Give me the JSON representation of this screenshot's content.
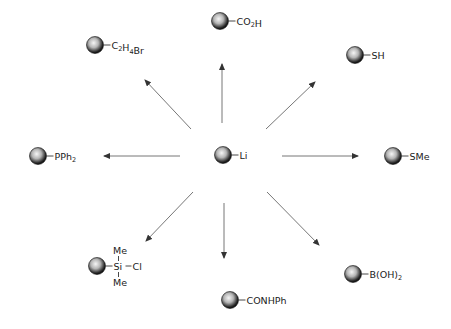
{
  "diagram": {
    "center": {
      "label": "Li",
      "x": 223,
      "y": 155
    },
    "nodes": [
      {
        "id": "co2h",
        "parts": [
          [
            "CO",
            ""
          ],
          [
            "2",
            "sub"
          ],
          [
            "H",
            ""
          ]
        ],
        "x": 220,
        "y": 21
      },
      {
        "id": "c2h4br",
        "parts": [
          [
            "C",
            ""
          ],
          [
            "2",
            "sub"
          ],
          [
            "H",
            ""
          ],
          [
            "4",
            "sub"
          ],
          [
            "Br",
            ""
          ]
        ],
        "x": 95,
        "y": 45
      },
      {
        "id": "sh",
        "parts": [
          [
            "SH",
            ""
          ]
        ],
        "x": 355,
        "y": 55
      },
      {
        "id": "pph2",
        "parts": [
          [
            "PPh",
            ""
          ],
          [
            "2",
            "sub"
          ]
        ],
        "x": 38,
        "y": 156
      },
      {
        "id": "sme",
        "parts": [
          [
            "SMe",
            ""
          ]
        ],
        "x": 393,
        "y": 156
      },
      {
        "id": "sime2cl",
        "parts": [
          [
            "Si",
            ""
          ]
        ],
        "x": 97,
        "y": 266,
        "extra": {
          "top": "Me",
          "bottom": "Me",
          "right": "Cl"
        }
      },
      {
        "id": "conhph",
        "parts": [
          [
            "CONHPh",
            ""
          ]
        ],
        "x": 230,
        "y": 300
      },
      {
        "id": "boh2",
        "parts": [
          [
            "B(OH)",
            ""
          ],
          [
            "2",
            "sub"
          ]
        ],
        "x": 353,
        "y": 274
      }
    ],
    "arrows": [
      {
        "to": "co2h",
        "x1": 222,
        "y1": 123,
        "x2": 222,
        "y2": 64
      },
      {
        "to": "c2h4br",
        "x1": 191,
        "y1": 129,
        "x2": 145,
        "y2": 80
      },
      {
        "to": "sh",
        "x1": 266,
        "y1": 129,
        "x2": 315,
        "y2": 82
      },
      {
        "to": "pph2",
        "x1": 180,
        "y1": 156,
        "x2": 104,
        "y2": 156
      },
      {
        "to": "sme",
        "x1": 282,
        "y1": 156,
        "x2": 358,
        "y2": 156
      },
      {
        "to": "sime2cl",
        "x1": 193,
        "y1": 192,
        "x2": 146,
        "y2": 241
      },
      {
        "to": "conhph",
        "x1": 224,
        "y1": 203,
        "x2": 224,
        "y2": 258
      },
      {
        "to": "boh2",
        "x1": 267,
        "y1": 192,
        "x2": 319,
        "y2": 245
      }
    ],
    "colors": {
      "sphere_dark": "#111111",
      "sphere_light": "#f4f4f4",
      "arrow": "#777777",
      "text": "#222222"
    }
  }
}
